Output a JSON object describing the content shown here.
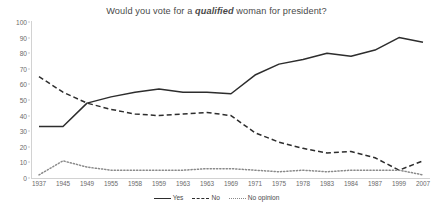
{
  "chart_data": {
    "type": "line",
    "title_prefix": "Would you vote for a ",
    "title_emphasis": "qualified",
    "title_suffix": " woman for president?",
    "title": "Would you vote for a qualified woman for president?",
    "xlabel": "",
    "ylabel": "",
    "ylim": [
      0,
      100
    ],
    "ytick_values": [
      0,
      10,
      20,
      30,
      40,
      50,
      60,
      70,
      80,
      90,
      100
    ],
    "ytick_labels": [
      "0",
      "10",
      "20",
      "30",
      "40",
      "50",
      "60",
      "70",
      "80",
      "90",
      "100"
    ],
    "grid": false,
    "legend_position": "bottom-center",
    "categories": [
      "1937",
      "1945",
      "1949",
      "1955",
      "1958",
      "1959",
      "1963",
      "1963",
      "1969",
      "1971",
      "1975",
      "1978",
      "1983",
      "1984",
      "1987",
      "1999",
      "2007"
    ],
    "series": [
      {
        "name": "Yes",
        "style": "solid",
        "color": "#2d2d2d",
        "values": [
          33,
          33,
          48,
          52,
          55,
          57,
          55,
          55,
          54,
          66,
          73,
          76,
          80,
          78,
          82,
          90,
          87
        ]
      },
      {
        "name": "No",
        "style": "dashed",
        "color": "#2d2d2d",
        "values": [
          65,
          55,
          48,
          44,
          41,
          40,
          41,
          42,
          40,
          29,
          23,
          19,
          16,
          17,
          13,
          5,
          11
        ]
      },
      {
        "name": "No opinion",
        "style": "dotted",
        "color": "#8a8a8a",
        "values": [
          2,
          11,
          7,
          5,
          5,
          5,
          5,
          6,
          6,
          5,
          4,
          5,
          4,
          5,
          5,
          5,
          2
        ]
      }
    ]
  },
  "legend": {
    "items": [
      {
        "label": "Yes",
        "style": "solid"
      },
      {
        "label": "No",
        "style": "dashed"
      },
      {
        "label": "No opinion",
        "style": "dotted"
      }
    ]
  }
}
